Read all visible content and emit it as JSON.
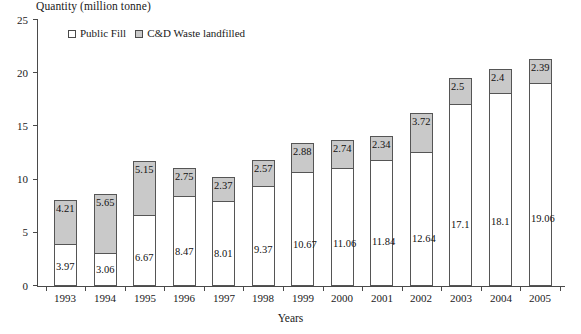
{
  "chart_data": {
    "type": "bar",
    "subtype": "stacked-vertical",
    "title": "",
    "ylabel": "Quantity (million tonne)",
    "xlabel": "Years",
    "ylim": [
      0,
      25
    ],
    "yticks": [
      0,
      5,
      10,
      15,
      20,
      25
    ],
    "grid": false,
    "legend_position": "top-left",
    "categories": [
      "1993",
      "1994",
      "1995",
      "1996",
      "1997",
      "1998",
      "1999",
      "2000",
      "2001",
      "2002",
      "2003",
      "2004",
      "2005"
    ],
    "series": [
      {
        "name": "Public Fill",
        "color": "#ffffff",
        "values": [
          3.97,
          3.06,
          6.67,
          8.47,
          8.01,
          9.37,
          10.67,
          11.06,
          11.84,
          12.64,
          17.1,
          18.1,
          19.06
        ],
        "labels": [
          "3.97",
          "3.06",
          "6.67",
          "8.47",
          "8.01",
          "9.37",
          "10.67",
          "11.06",
          "11.84",
          "12.64",
          "17.1",
          "18.1",
          "19.06"
        ]
      },
      {
        "name": "C&D Waste landfilled",
        "color": "#c9c9c9",
        "values": [
          4.21,
          5.65,
          5.15,
          2.75,
          2.37,
          2.57,
          2.88,
          2.74,
          2.34,
          3.72,
          2.5,
          2.4,
          2.39
        ],
        "labels": [
          "4.21",
          "5.65",
          "5.15",
          "2.75",
          "2.37",
          "2.57",
          "2.88",
          "2.74",
          "2.34",
          "3.72",
          "2.5",
          "2.4",
          "2.39"
        ]
      }
    ],
    "totals": [
      8.18,
      8.71,
      11.82,
      11.22,
      10.38,
      11.94,
      13.55,
      13.8,
      14.18,
      16.36,
      19.6,
      20.5,
      21.45
    ]
  },
  "legend": {
    "entries": [
      {
        "label": "Public Fill",
        "swatch": "white-square-icon"
      },
      {
        "label": "C&D Waste landfilled",
        "swatch": "gray-square-icon"
      }
    ]
  },
  "colors": {
    "public_fill": "#ffffff",
    "cd_waste": "#c9c9c9",
    "axis": "#4a4a4a",
    "text": "#1a1a1a"
  }
}
